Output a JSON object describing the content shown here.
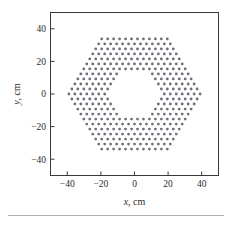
{
  "figure": {
    "name": "hexagonal-lattice-scatter"
  },
  "chart_data": {
    "type": "scatter",
    "title": "",
    "xlabel": "x, cm",
    "ylabel": "y, cm",
    "xlabel_var": "x",
    "xlabel_unit": ", cm",
    "ylabel_var": "y",
    "ylabel_unit": ", cm",
    "xlim": [
      -50,
      50
    ],
    "ylim": [
      -50,
      50
    ],
    "xticks": [
      -40,
      -20,
      0,
      20,
      40
    ],
    "yticks": [
      -40,
      -20,
      0,
      20,
      40
    ],
    "xticklabels": [
      "−40",
      "−20",
      "0",
      "20",
      "40"
    ],
    "yticklabels": [
      "−40",
      "−20",
      "0",
      "20",
      "40"
    ],
    "grid": false,
    "legend": null,
    "marker": "point",
    "marker_color": "#6e6e78",
    "marker_size": 1.4,
    "lattice": {
      "type": "triangular",
      "pitch_cm": 3.55,
      "outer_boundary": "hexagon",
      "outer_flat_to_flat_cm": 70,
      "outer_circumradius_cm": 40.4,
      "inner_void": "hexagon",
      "inner_circumradius_cm": 17.6,
      "orientation_deg": 0
    },
    "point_count_approx": 420
  },
  "footer": {
    "rule": true
  }
}
